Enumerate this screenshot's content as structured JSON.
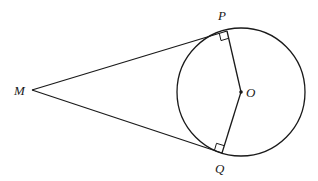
{
  "diagram": {
    "colors": {
      "stroke": "#1a1a1a",
      "background": "#ffffff"
    },
    "points": {
      "M": {
        "label": "M",
        "x": 32,
        "y": 90
      },
      "P": {
        "label": "P",
        "x": 227,
        "y": 31
      },
      "Q": {
        "label": "Q",
        "x": 222,
        "y": 153
      },
      "O": {
        "label": "O",
        "x": 241,
        "y": 92
      }
    },
    "circle": {
      "center": "O",
      "cx": 241,
      "cy": 92,
      "r": 64
    },
    "segments": [
      {
        "from": "M",
        "to": "P",
        "kind": "tangent"
      },
      {
        "from": "M",
        "to": "Q",
        "kind": "tangent"
      },
      {
        "from": "O",
        "to": "P",
        "kind": "radius"
      },
      {
        "from": "O",
        "to": "Q",
        "kind": "radius"
      }
    ],
    "right_angle_marks": [
      "P",
      "Q"
    ],
    "labels": {
      "M": "M",
      "P": "P",
      "Q": "Q",
      "O": "O"
    }
  }
}
